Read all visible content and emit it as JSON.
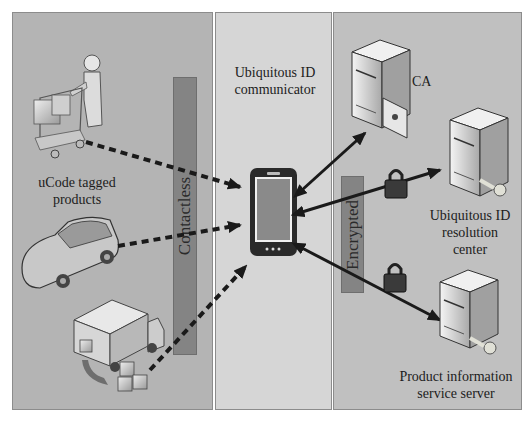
{
  "panels": {
    "left": {
      "label_lines": [
        "uCode tagged",
        "products"
      ]
    },
    "middle": {
      "label_lines": [
        "Ubiquitous ID",
        "communicator"
      ]
    },
    "right": {
      "ca_label": "CA",
      "resolution_center_lines": [
        "Ubiquitous ID",
        "resolution",
        "center"
      ],
      "product_server_lines": [
        "Product information",
        "service server"
      ]
    }
  },
  "channels": {
    "contactless": "Contactless",
    "encrypted": "Encrypted"
  },
  "icons": {
    "shopper": "shopping-cart-person-icon",
    "car": "car-icon",
    "truck": "delivery-truck-icon",
    "phone": "smartphone-icon",
    "ca_server": "server-certificate-icon",
    "resolution_server": "server-key-icon",
    "product_server": "server-key-icon",
    "lock": "padlock-icon"
  },
  "colors": {
    "left_panel": "#b4b4b4",
    "middle_panel": "#d6d6d6",
    "right_panel": "#c0c0c0",
    "bar": "#848484",
    "arrow": "#1a1a1a"
  }
}
